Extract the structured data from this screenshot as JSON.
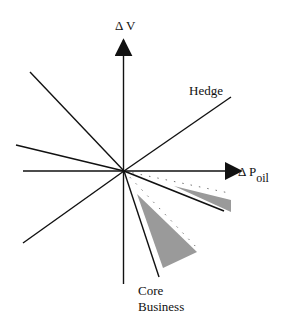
{
  "diagram": {
    "axes": {
      "y_label": "Δ V",
      "x_label_main": "Δ P",
      "x_label_sub": "oil"
    },
    "labels": {
      "hedge": "Hedge",
      "core_line1": "Core",
      "core_line2": "Business"
    },
    "colors": {
      "line": "#111111",
      "shade": "#9a9a9a",
      "dots": "#777777",
      "background": "#ffffff"
    },
    "rays": [
      {
        "name": "ray-upper-left",
        "style": "solid",
        "angle_deg": 136
      },
      {
        "name": "ray-left-shallow",
        "style": "solid",
        "angle_deg": 164
      },
      {
        "name": "ray-lower-left",
        "style": "solid",
        "angle_deg": 216
      },
      {
        "name": "ray-hedge",
        "style": "solid",
        "angle_deg": 35
      },
      {
        "name": "ray-right-lower",
        "style": "solid",
        "angle_deg": -21
      },
      {
        "name": "ray-core-business",
        "style": "solid",
        "angle_deg": -70
      },
      {
        "name": "ray-dotted-right",
        "style": "dotted",
        "angle_deg": -11
      },
      {
        "name": "ray-dotted-core",
        "style": "dotted",
        "angle_deg": -45
      }
    ],
    "shaded_regions": [
      {
        "name": "shaded-sliver-right",
        "description": "Thin shaded wedge between dotted ray and lower-right solid ray"
      },
      {
        "name": "shaded-wedge-core",
        "description": "Shaded wedge between core business ray and dotted ray"
      }
    ]
  }
}
